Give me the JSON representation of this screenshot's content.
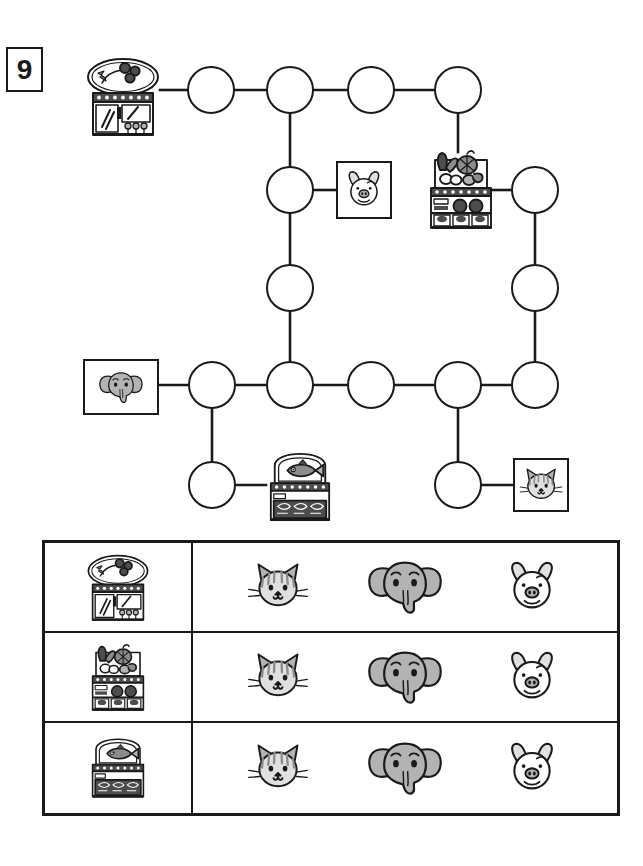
{
  "exercise": {
    "number": "9"
  },
  "worksheet": {
    "kind": "maze-matching-worksheet",
    "description": "Connect shops to animals along the path, then fill the table."
  },
  "maze": {
    "nodes": [
      {
        "id": "n1",
        "name": "node-top-1",
        "cx": 211,
        "cy": 90,
        "r": 24
      },
      {
        "id": "n2",
        "name": "node-top-2",
        "cx": 290,
        "cy": 90,
        "r": 24
      },
      {
        "id": "n3",
        "name": "node-top-3",
        "cx": 371,
        "cy": 90,
        "r": 24
      },
      {
        "id": "n4",
        "name": "node-top-4",
        "cx": 458,
        "cy": 90,
        "r": 24
      },
      {
        "id": "n5",
        "name": "node-mid-left-1",
        "cx": 290,
        "cy": 190,
        "r": 24
      },
      {
        "id": "n6",
        "name": "node-mid-left-2",
        "cx": 290,
        "cy": 288,
        "r": 24
      },
      {
        "id": "n7",
        "name": "node-mid-right-1",
        "cx": 535,
        "cy": 190,
        "r": 24
      },
      {
        "id": "n8",
        "name": "node-mid-right-2",
        "cx": 535,
        "cy": 288,
        "r": 24
      },
      {
        "id": "n9",
        "name": "node-row-1",
        "cx": 212,
        "cy": 385,
        "r": 24
      },
      {
        "id": "n10",
        "name": "node-row-2",
        "cx": 290,
        "cy": 385,
        "r": 24
      },
      {
        "id": "n11",
        "name": "node-row-3",
        "cx": 371,
        "cy": 385,
        "r": 24
      },
      {
        "id": "n12",
        "name": "node-row-4",
        "cx": 458,
        "cy": 385,
        "r": 24
      },
      {
        "id": "n13",
        "name": "node-row-5",
        "cx": 535,
        "cy": 385,
        "r": 24
      },
      {
        "id": "n14",
        "name": "node-bottom-left",
        "cx": 212,
        "cy": 485,
        "r": 24
      },
      {
        "id": "n15",
        "name": "node-bottom-right",
        "cx": 458,
        "cy": 485,
        "r": 24
      }
    ],
    "edges": [
      {
        "x1": 160,
        "y1": 90,
        "x2": 187,
        "y2": 90
      },
      {
        "x1": 235,
        "y1": 90,
        "x2": 266,
        "y2": 90
      },
      {
        "x1": 314,
        "y1": 90,
        "x2": 347,
        "y2": 90
      },
      {
        "x1": 395,
        "y1": 90,
        "x2": 434,
        "y2": 90
      },
      {
        "x1": 290,
        "y1": 114,
        "x2": 290,
        "y2": 166
      },
      {
        "x1": 458,
        "y1": 114,
        "x2": 458,
        "y2": 152
      },
      {
        "x1": 314,
        "y1": 190,
        "x2": 336,
        "y2": 190
      },
      {
        "x1": 484,
        "y1": 190,
        "x2": 511,
        "y2": 190
      },
      {
        "x1": 290,
        "y1": 214,
        "x2": 290,
        "y2": 264
      },
      {
        "x1": 535,
        "y1": 214,
        "x2": 535,
        "y2": 264
      },
      {
        "x1": 290,
        "y1": 312,
        "x2": 290,
        "y2": 361
      },
      {
        "x1": 535,
        "y1": 312,
        "x2": 535,
        "y2": 361
      },
      {
        "x1": 158,
        "y1": 385,
        "x2": 188,
        "y2": 385
      },
      {
        "x1": 236,
        "y1": 385,
        "x2": 266,
        "y2": 385
      },
      {
        "x1": 314,
        "y1": 385,
        "x2": 347,
        "y2": 385
      },
      {
        "x1": 395,
        "y1": 385,
        "x2": 434,
        "y2": 385
      },
      {
        "x1": 482,
        "y1": 385,
        "x2": 511,
        "y2": 385
      },
      {
        "x1": 212,
        "y1": 409,
        "x2": 212,
        "y2": 461
      },
      {
        "x1": 458,
        "y1": 409,
        "x2": 458,
        "y2": 461
      },
      {
        "x1": 236,
        "y1": 485,
        "x2": 266,
        "y2": 485
      },
      {
        "x1": 482,
        "y1": 485,
        "x2": 513,
        "y2": 485
      }
    ],
    "shops": [
      {
        "id": "flower-shop-maze",
        "icon": "flower-shop",
        "label": "flower shop",
        "x": 84,
        "y": 55,
        "w": 78,
        "h": 82
      },
      {
        "id": "vegetable-shop-maze",
        "icon": "vegetable-shop",
        "label": "vegetable shop",
        "x": 422,
        "y": 148,
        "w": 78,
        "h": 82
      },
      {
        "id": "fish-shop-maze",
        "icon": "fish-shop",
        "label": "fish shop",
        "x": 261,
        "y": 452,
        "w": 78,
        "h": 70
      }
    ],
    "animal_boxes": [
      {
        "id": "pig-box",
        "icon": "pig-face",
        "label": "pig",
        "x": 336,
        "y": 161,
        "w": 56,
        "h": 58
      },
      {
        "id": "elephant-box",
        "icon": "elephant-face",
        "label": "elephant",
        "x": 83,
        "y": 359,
        "w": 76,
        "h": 56
      },
      {
        "id": "cat-box",
        "icon": "cat-face",
        "label": "cat",
        "x": 513,
        "y": 458,
        "w": 56,
        "h": 54
      }
    ]
  },
  "table": {
    "rows": [
      {
        "shop": {
          "icon": "flower-shop",
          "label": "flower shop"
        },
        "animals": [
          {
            "icon": "cat-face",
            "label": "cat"
          },
          {
            "icon": "elephant-face",
            "label": "elephant"
          },
          {
            "icon": "pig-face",
            "label": "pig"
          }
        ]
      },
      {
        "shop": {
          "icon": "vegetable-shop",
          "label": "vegetable shop"
        },
        "animals": [
          {
            "icon": "cat-face",
            "label": "cat"
          },
          {
            "icon": "elephant-face",
            "label": "elephant"
          },
          {
            "icon": "pig-face",
            "label": "pig"
          }
        ]
      },
      {
        "shop": {
          "icon": "fish-shop",
          "label": "fish shop"
        },
        "animals": [
          {
            "icon": "cat-face",
            "label": "cat"
          },
          {
            "icon": "elephant-face",
            "label": "elephant"
          },
          {
            "icon": "pig-face",
            "label": "pig"
          }
        ]
      }
    ]
  },
  "colors": {
    "ink": "#1a1a1a",
    "paper": "#ffffff",
    "fill_gray": "#b3b3b3",
    "fill_light": "#e0e0e0",
    "fill_mid": "#8c8c8c",
    "fill_dark": "#4d4d4d"
  }
}
